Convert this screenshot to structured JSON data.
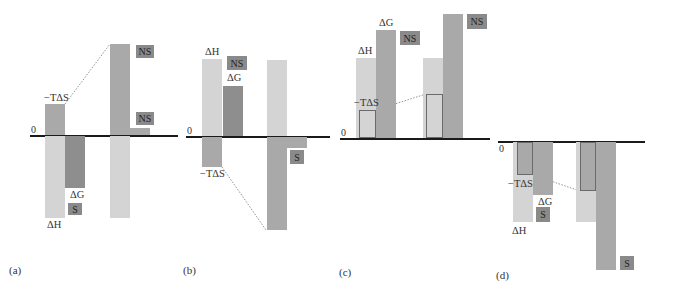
{
  "figure": {
    "panels": [
      {
        "id": "a",
        "caption": "(a)",
        "zero_label": "0",
        "labels": {
          "minus_tds": "−TΔS",
          "delta_g": "ΔG",
          "delta_h": "ΔH"
        },
        "tags": [
          "NS",
          "NS",
          "S"
        ]
      },
      {
        "id": "b",
        "caption": "(b)",
        "zero_label": "0",
        "labels": {
          "delta_h": "ΔH",
          "delta_g": "ΔG",
          "minus_tds": "−TΔS"
        },
        "tags": [
          "NS",
          "S"
        ]
      },
      {
        "id": "c",
        "caption": "(c)",
        "zero_label": "0",
        "labels": {
          "delta_g": "ΔG",
          "delta_h": "ΔH",
          "minus_tds": "−TΔS"
        },
        "tags": [
          "NS",
          "NS"
        ]
      },
      {
        "id": "d",
        "caption": "(d)",
        "zero_label": "0",
        "labels": {
          "minus_tds": "−TΔS",
          "delta_g": "ΔG",
          "delta_h": "ΔH"
        },
        "tags": [
          "S",
          "S"
        ]
      }
    ]
  }
}
